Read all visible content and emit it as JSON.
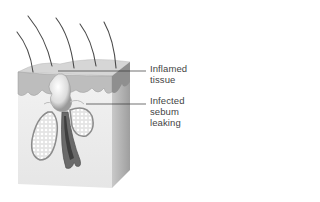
{
  "figure": {
    "labels": [
      {
        "id": "inflamed",
        "lines": [
          "Inflamed",
          "tissue"
        ]
      },
      {
        "id": "sebum",
        "lines": [
          "Infected",
          "sebum",
          "leaking"
        ]
      }
    ],
    "colors": {
      "background": "#ffffff",
      "skin_top": "#d8d8d8",
      "skin_side": "#a9a9a9",
      "dermis": "#eeeeee",
      "hair": "#4a4a4a",
      "label_text": "#444444",
      "leader_line": "#333333"
    }
  }
}
